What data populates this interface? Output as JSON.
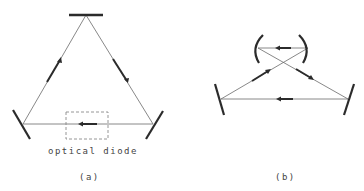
{
  "figure": {
    "panel_a": {
      "caption": "(a)",
      "annotation": "optical diode",
      "description": "Triangular ring laser cavity with three flat mirrors and an optical diode in the bottom leg"
    },
    "panel_b": {
      "caption": "(b)",
      "description": "Bow-tie (figure-eight) ring cavity with two curved mirrors on top and two flat mirrors at the bottom"
    }
  },
  "colors": {
    "beam": "#6a6a6a",
    "mirror": "#2b2b2b",
    "arrow": "#2b2b2b",
    "diode_box": "#8a8a8a",
    "text": "#444444"
  }
}
